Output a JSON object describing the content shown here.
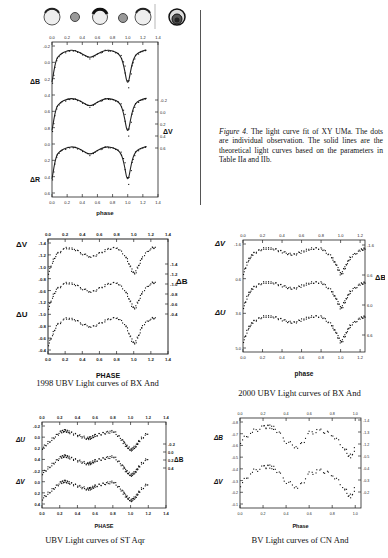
{
  "figure4": {
    "caption_label": "Figure 4.",
    "caption_text": " The light curve fit of XY UMa. The dots are individual observation. The solid lines are the theoretical light curves based on the parameters in Table IIa and IIb.",
    "xlabel": "phase",
    "left_labels": [
      "ΔB",
      "ΔR"
    ],
    "right_labels": [
      "ΔV"
    ],
    "top_ticks": [
      "0.0",
      "0.2",
      "0.4",
      "0.6",
      "0.8",
      "1.0",
      "1.2",
      "1.4"
    ],
    "bottom_ticks": [
      "0.0",
      "0.2",
      "0.4",
      "0.6",
      "0.8",
      "1.0",
      "1.2",
      "1.4"
    ],
    "left_ticks": [
      "-0.2",
      "0.0",
      "0.2",
      "0.4",
      "0.6",
      "0.8",
      "0.0",
      "0.2",
      "0.4",
      "0.6"
    ],
    "right_ticks": [
      "-0.2",
      "0.0",
      "0.2",
      "0.4",
      "0.6"
    ]
  },
  "panels": [
    {
      "id": "bx-and-1998",
      "caption": "1998 UBV Light curves of  BX And",
      "xlabel": "PHASE",
      "left_labels": [
        "ΔV",
        "ΔU"
      ],
      "right_labels": [
        "ΔB"
      ],
      "top_ticks": [
        "0.0",
        "0.2",
        "0.4",
        "0.6",
        "0.8",
        "1.0",
        "1.2",
        "1.4"
      ],
      "bottom_ticks": [
        "0.0",
        "0.2",
        "0.4",
        "0.6",
        "0.8",
        "1.0",
        "1.2",
        "1.4"
      ],
      "left_ticks": [
        "-1.4",
        "-1.2",
        "-1.0",
        "-0.8",
        "-0.6",
        "-1.2",
        "-1.0",
        "-0.8",
        "-0.6",
        "-0.4"
      ],
      "right_ticks": [
        "-1.4",
        "-1.2",
        "-1.0",
        "-0.8",
        "-0.6",
        "-0.4"
      ]
    },
    {
      "id": "bx-and-2000",
      "caption": "2000 UBV Light curves of  BX And",
      "xlabel": "phase",
      "left_labels": [
        "ΔV",
        "ΔU"
      ],
      "right_labels": [
        "ΔB"
      ],
      "top_ticks": [
        "0.0",
        "0.2",
        "0.4",
        "0.6",
        "0.8",
        "1.0",
        "1.2"
      ],
      "bottom_ticks": [
        "0.0",
        "0.2",
        "0.4",
        "0.6",
        "0.8",
        "1.0",
        "1.2"
      ],
      "left_ticks": [
        "-1.6",
        "0.6",
        "3.6",
        "5.0"
      ],
      "right_ticks": [
        "-1.6",
        "0.6",
        "6.0",
        "6.6"
      ]
    },
    {
      "id": "st-aqr",
      "caption": "UBV Light curves of  ST Aqr",
      "xlabel": "PHASE",
      "left_labels": [
        "ΔU",
        "ΔV"
      ],
      "right_labels": [
        "ΔB"
      ],
      "top_ticks": [
        "0.0",
        "0.2",
        "0.4",
        "0.6",
        "0.8",
        "1.0",
        "1.2",
        "1.4"
      ],
      "bottom_ticks": [
        "0.0",
        "0.2",
        "0.4",
        "0.6",
        "0.8",
        "1.0",
        "1.2",
        "1.4"
      ],
      "left_ticks": [
        "-0.2",
        "0.0",
        "0.2",
        "0.4",
        "-0.2",
        "0.0",
        "0.2",
        "0.4"
      ],
      "right_ticks": [
        "-0.2",
        "0.0",
        "0.2",
        "0.4"
      ]
    },
    {
      "id": "cn-and",
      "caption": "BV Light curves of  CN And",
      "xlabel": "Phase",
      "left_labels": [
        "ΔB",
        "ΔV"
      ],
      "right_labels": [],
      "top_ticks": [
        "0.0",
        "0.2",
        "0.4",
        "0.6",
        "0.8",
        "1.0"
      ],
      "bottom_ticks": [
        "0.0",
        "0.2",
        "0.4",
        "0.6",
        "0.8",
        "1.0"
      ],
      "left_ticks": [
        "-0.8",
        "-0.7",
        "-0.6",
        "-0.5",
        "-0.4",
        "-0.3",
        "-0.2",
        "-0.1"
      ],
      "right_ticks": [
        "-1.4",
        "-1.3",
        "-1.2",
        "-0.5",
        "-0.4",
        "-0.3",
        "-0.2"
      ]
    }
  ],
  "chart_data": [
    {
      "type": "scatter",
      "title": "Figure 4. Light curve fit of XY UMa",
      "xlabel": "phase",
      "ylabel": "ΔB / ΔV / ΔR (mag)",
      "x": [
        0.0,
        0.05,
        0.1,
        0.2,
        0.3,
        0.4,
        0.5,
        0.6,
        0.7,
        0.8,
        0.9,
        0.95,
        1.0,
        1.05,
        1.1,
        1.2,
        1.25
      ],
      "series": [
        {
          "name": "ΔB",
          "values": [
            0.45,
            0.05,
            -0.05,
            -0.12,
            -0.13,
            -0.06,
            0.02,
            -0.06,
            -0.13,
            -0.12,
            -0.05,
            0.15,
            0.55,
            0.15,
            -0.05,
            -0.12,
            -0.13
          ]
        },
        {
          "name": "ΔV",
          "values": [
            0.45,
            0.05,
            -0.05,
            -0.12,
            -0.13,
            -0.06,
            0.02,
            -0.06,
            -0.13,
            -0.12,
            -0.05,
            0.15,
            0.55,
            0.15,
            -0.05,
            -0.12,
            -0.13
          ]
        },
        {
          "name": "ΔR",
          "values": [
            0.45,
            0.05,
            -0.05,
            -0.12,
            -0.13,
            -0.06,
            0.02,
            -0.06,
            -0.13,
            -0.12,
            -0.05,
            0.15,
            0.55,
            0.15,
            -0.05,
            -0.12,
            -0.13
          ]
        }
      ],
      "xlim": [
        0.0,
        1.4
      ],
      "grid": false
    },
    {
      "type": "scatter",
      "title": "1998 UBV Light curves of BX And",
      "xlabel": "PHASE",
      "x": [
        0.0,
        0.05,
        0.1,
        0.2,
        0.3,
        0.4,
        0.5,
        0.6,
        0.7,
        0.8,
        0.9,
        0.95,
        1.0,
        1.05,
        1.1,
        1.2,
        1.25
      ],
      "series": [
        {
          "name": "ΔV",
          "values": [
            -0.75,
            -1.0,
            -1.15,
            -1.27,
            -1.25,
            -1.15,
            -1.08,
            -1.16,
            -1.25,
            -1.28,
            -1.1,
            -0.9,
            -0.72,
            -0.9,
            -1.1,
            -1.27,
            -1.28
          ]
        },
        {
          "name": "ΔB",
          "values": [
            -0.75,
            -1.0,
            -1.15,
            -1.27,
            -1.25,
            -1.15,
            -1.08,
            -1.16,
            -1.25,
            -1.28,
            -1.1,
            -0.9,
            -0.72,
            -0.9,
            -1.1,
            -1.27,
            -1.28
          ]
        },
        {
          "name": "ΔU",
          "values": [
            -0.45,
            -0.7,
            -0.9,
            -1.05,
            -1.03,
            -0.92,
            -0.85,
            -0.93,
            -1.03,
            -1.07,
            -0.9,
            -0.65,
            -0.45,
            -0.65,
            -0.9,
            -1.05,
            -1.06
          ]
        }
      ],
      "xlim": [
        0.0,
        1.4
      ]
    },
    {
      "type": "scatter",
      "title": "2000 UBV Light curves of BX And",
      "xlabel": "phase",
      "x": [
        0.0,
        0.05,
        0.1,
        0.2,
        0.3,
        0.4,
        0.5,
        0.6,
        0.7,
        0.8,
        0.9,
        0.95,
        1.0,
        1.05,
        1.1,
        1.2,
        1.25
      ],
      "series": [
        {
          "name": "ΔV",
          "values": [
            0.7,
            0.3,
            0.1,
            -0.05,
            -0.05,
            0.05,
            0.15,
            0.05,
            -0.05,
            -0.05,
            0.2,
            0.45,
            0.75,
            0.45,
            0.2,
            0.0,
            -0.05
          ]
        },
        {
          "name": "ΔB",
          "values": [
            0.7,
            0.3,
            0.1,
            -0.05,
            -0.05,
            0.05,
            0.15,
            0.05,
            -0.05,
            -0.05,
            0.2,
            0.45,
            0.75,
            0.45,
            0.2,
            0.0,
            -0.05
          ]
        },
        {
          "name": "ΔU",
          "values": [
            0.7,
            0.3,
            0.1,
            -0.05,
            -0.05,
            0.05,
            0.15,
            0.05,
            -0.05,
            -0.05,
            0.2,
            0.45,
            0.75,
            0.45,
            0.2,
            0.0,
            -0.05
          ]
        }
      ],
      "xlim": [
        0.0,
        1.25
      ]
    },
    {
      "type": "scatter",
      "title": "UBV Light curves of ST Aqr",
      "xlabel": "PHASE",
      "x": [
        0.0,
        0.1,
        0.2,
        0.25,
        0.3,
        0.4,
        0.5,
        0.55,
        0.6,
        0.7,
        0.8,
        0.9,
        0.95,
        1.0,
        1.05,
        1.1,
        1.2
      ],
      "series": [
        {
          "name": "ΔU",
          "values": [
            0.35,
            0.1,
            -0.15,
            -0.2,
            -0.15,
            -0.05,
            0.05,
            0.03,
            -0.05,
            -0.12,
            -0.18,
            0.1,
            0.3,
            0.42,
            0.3,
            0.1,
            -0.15
          ]
        },
        {
          "name": "ΔB",
          "values": [
            0.35,
            0.1,
            -0.15,
            -0.2,
            -0.15,
            -0.05,
            0.05,
            0.03,
            -0.05,
            -0.12,
            -0.18,
            0.1,
            0.3,
            0.42,
            0.3,
            0.1,
            -0.15
          ]
        },
        {
          "name": "ΔV",
          "values": [
            0.35,
            0.1,
            -0.15,
            -0.2,
            -0.15,
            -0.05,
            0.05,
            0.03,
            -0.05,
            -0.12,
            -0.18,
            0.1,
            0.3,
            0.42,
            0.3,
            0.1,
            -0.15
          ]
        }
      ],
      "xlim": [
        0.0,
        1.4
      ]
    },
    {
      "type": "scatter",
      "title": "BV Light curves of CN And",
      "xlabel": "Phase",
      "x": [
        0.0,
        0.1,
        0.2,
        0.25,
        0.3,
        0.4,
        0.5,
        0.6,
        0.7,
        0.8,
        0.9,
        0.95,
        1.0
      ],
      "series": [
        {
          "name": "ΔB",
          "values": [
            -0.55,
            -0.7,
            -0.77,
            -0.78,
            -0.75,
            -0.55,
            -0.45,
            -0.68,
            -0.72,
            -0.65,
            -0.45,
            -0.3,
            -0.45
          ]
        },
        {
          "name": "ΔV",
          "values": [
            -0.35,
            -0.55,
            -0.62,
            -0.63,
            -0.6,
            -0.4,
            -0.3,
            -0.52,
            -0.57,
            -0.5,
            -0.3,
            -0.15,
            -0.3
          ]
        }
      ],
      "xlim": [
        0.0,
        1.05
      ]
    }
  ]
}
